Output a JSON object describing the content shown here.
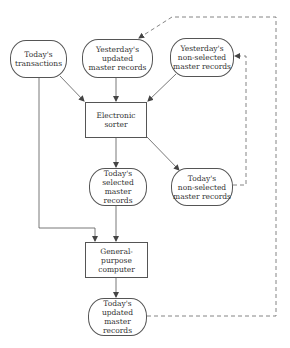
{
  "diagram": {
    "type": "flowchart",
    "nodes": {
      "todays_transactions": {
        "label": "Today's\ntransactions",
        "shape": "terminal"
      },
      "yesterdays_updated": {
        "label": "Yesterday's\nupdated\nmaster records",
        "shape": "terminal"
      },
      "yesterdays_nonselected": {
        "label": "Yesterday's\nnon-selected\nmaster records",
        "shape": "terminal"
      },
      "electronic_sorter": {
        "label": "Electronic\nsorter",
        "shape": "process"
      },
      "todays_selected": {
        "label": "Today's\nselected\nmaster\nrecords",
        "shape": "terminal"
      },
      "todays_nonselected": {
        "label": "Today's\nnon-selected\nmaster records",
        "shape": "terminal"
      },
      "general_purpose_computer": {
        "label": "General-purpose\ncomputer",
        "shape": "process"
      },
      "todays_updated": {
        "label": "Today's\nupdated\nmaster\nrecords",
        "shape": "terminal"
      }
    },
    "edges": [
      {
        "from": "todays_transactions",
        "to": "electronic_sorter",
        "style": "solid"
      },
      {
        "from": "yesterdays_updated",
        "to": "electronic_sorter",
        "style": "solid"
      },
      {
        "from": "yesterdays_nonselected",
        "to": "electronic_sorter",
        "style": "solid"
      },
      {
        "from": "electronic_sorter",
        "to": "todays_selected",
        "style": "solid"
      },
      {
        "from": "electronic_sorter",
        "to": "todays_nonselected",
        "style": "solid"
      },
      {
        "from": "todays_transactions",
        "to": "general_purpose_computer",
        "style": "solid"
      },
      {
        "from": "todays_selected",
        "to": "general_purpose_computer",
        "style": "solid"
      },
      {
        "from": "general_purpose_computer",
        "to": "todays_updated",
        "style": "solid"
      },
      {
        "from": "todays_nonselected",
        "to": "yesterdays_nonselected",
        "style": "dashed"
      },
      {
        "from": "todays_updated",
        "to": "yesterdays_updated",
        "style": "dashed"
      }
    ],
    "colors": {
      "line": "#555555",
      "text": "#333333",
      "background": "#ffffff"
    }
  }
}
